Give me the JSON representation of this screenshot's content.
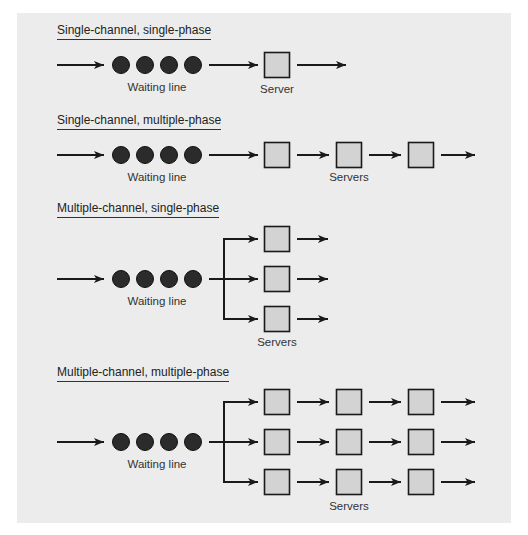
{
  "colors": {
    "background": "#ececec",
    "customer": "#2b2b2b",
    "server_fill": "#d3d3d3",
    "stroke": "#1a1a1a"
  },
  "sections": [
    {
      "title": "Single-channel, single-phase",
      "queue_label": "Waiting line",
      "server_label": "Server",
      "channels": 1,
      "phases": 1,
      "customers": 4
    },
    {
      "title": "Single-channel, multiple-phase",
      "queue_label": "Waiting line",
      "server_label": "Servers",
      "channels": 1,
      "phases": 3,
      "customers": 4
    },
    {
      "title": "Multiple-channel, single-phase",
      "queue_label": "Waiting line",
      "server_label": "Servers",
      "channels": 3,
      "phases": 1,
      "customers": 4
    },
    {
      "title": "Multiple-channel, multiple-phase",
      "queue_label": "Waiting line",
      "server_label": "Servers",
      "channels": 3,
      "phases": 3,
      "customers": 4
    }
  ],
  "icons": {
    "customer": "filled-circle",
    "server": "square",
    "flow": "arrow-right"
  }
}
